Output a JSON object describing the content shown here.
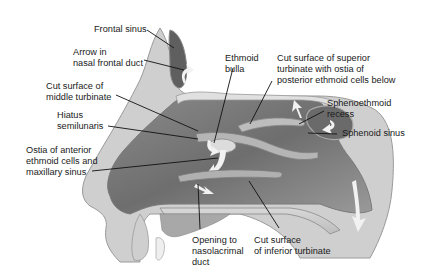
{
  "diagram": {
    "type": "anatomical-illustration",
    "labels": [
      {
        "id": "frontal-sinus",
        "text": "Frontal sinus"
      },
      {
        "id": "arrow-nasal-frontal-duct",
        "text": "Arrow in\nnasal frontal duct"
      },
      {
        "id": "cut-surface-middle-turbinate",
        "text": "Cut surface of\nmiddle turbinate"
      },
      {
        "id": "hiatus-semilunaris",
        "text": "Hiatus\nsemilunaris"
      },
      {
        "id": "ostia-anterior-ethmoid",
        "text": "Ostia of anterior\nethmoid cells and\nmaxillary sinus"
      },
      {
        "id": "ethmoid-bulla",
        "text": "Ethmoid\nbulla"
      },
      {
        "id": "cut-surface-superior-turbinate",
        "text": "Cut surface of superior\nturbinate with ostia of\nposterior ethmoid cells below"
      },
      {
        "id": "sphenoethmoid-recess",
        "text": "Sphenoethmoid\nrecess"
      },
      {
        "id": "sphenoid-sinus",
        "text": "Sphenoid sinus"
      },
      {
        "id": "opening-nasolacrimal-duct",
        "text": "Opening to\nnasolacrimal\nduct"
      },
      {
        "id": "cut-surface-inferior-turbinate",
        "text": "Cut surface\nof inferior turbinate"
      }
    ]
  }
}
